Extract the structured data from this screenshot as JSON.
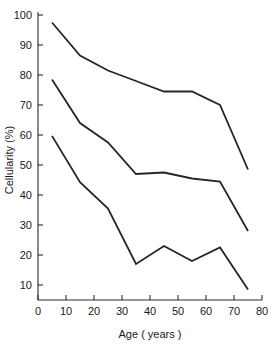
{
  "chart_data": {
    "type": "line",
    "title": "",
    "xlabel": "Age ( years )",
    "ylabel": "Cellularity (%)",
    "xlim": [
      0,
      80
    ],
    "ylim": [
      0,
      100
    ],
    "x_ticks": [
      0,
      10,
      20,
      30,
      40,
      50,
      60,
      70,
      80
    ],
    "x_tick_labels": [
      "0",
      "10",
      "20",
      "30",
      "40",
      "50",
      "60",
      "70",
      "80"
    ],
    "y_ticks": [
      10,
      20,
      30,
      40,
      50,
      60,
      70,
      80,
      90,
      100
    ],
    "y_tick_labels": [
      "10",
      "20",
      "30",
      "40",
      "50",
      "60",
      "70",
      "80",
      "90",
      "100"
    ],
    "grid": false,
    "legend": false,
    "x": [
      5,
      15,
      25,
      35,
      45,
      55,
      65,
      75
    ],
    "series": [
      {
        "name": "upper-percentile",
        "color": "#262626",
        "values": [
          97.5,
          86.5,
          81.5,
          78.0,
          74.5,
          74.5,
          70.0,
          48.5
        ]
      },
      {
        "name": "median",
        "color": "#262626",
        "values": [
          78.5,
          64.0,
          57.5,
          47.0,
          47.5,
          45.5,
          44.5,
          28.0
        ]
      },
      {
        "name": "lower-percentile",
        "color": "#262626",
        "values": [
          59.7,
          44.3,
          35.5,
          17.0,
          23.0,
          18.0,
          22.5,
          8.5
        ]
      }
    ]
  },
  "labels": {
    "y_axis_title": "Cellularity (%)",
    "x_axis_title": "Age ( years )"
  }
}
